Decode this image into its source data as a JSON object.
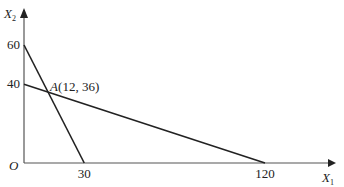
{
  "chart_data": {
    "type": "line",
    "title": "",
    "xlabel": "X",
    "xlabel_sub": "1",
    "ylabel": "X",
    "ylabel_sub": "2",
    "origin_label": "O",
    "x_ticks": [
      30,
      120
    ],
    "y_ticks": [
      40,
      60
    ],
    "xlim": [
      0,
      130
    ],
    "ylim": [
      0,
      70
    ],
    "grid": false,
    "series": [
      {
        "name": "line-1",
        "points": [
          [
            0,
            60
          ],
          [
            30,
            0
          ]
        ]
      },
      {
        "name": "line-2",
        "points": [
          [
            0,
            40
          ],
          [
            120,
            0
          ]
        ]
      }
    ],
    "annotations": [
      {
        "label_italic": "A",
        "label_rest": "(12,  36)",
        "x": 12,
        "y": 36
      }
    ]
  },
  "colors": {
    "axis": "#555555",
    "line": "#222222",
    "text": "#222222"
  }
}
